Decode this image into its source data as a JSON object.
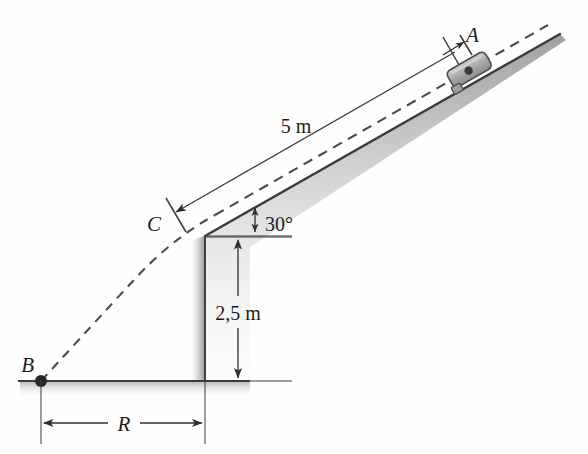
{
  "figure": {
    "background_color": "#fefefe",
    "line_color": "#3a3a3a",
    "shade_color": "#b9b9b9",
    "labels": {
      "point_a": "A",
      "point_b": "B",
      "point_c": "C",
      "incline_length": "5 m",
      "incline_angle": "30°",
      "wall_height": "2,5 m",
      "range": "R"
    },
    "geometry": {
      "incline_top_x": 560,
      "incline_top_y": 34,
      "incline_corner_x": 205,
      "incline_corner_y": 236,
      "wall_bottom_y": 381,
      "ground_left_x": 18,
      "ground_right_x": 250,
      "point_b_x": 41,
      "point_b_y": 381
    }
  }
}
